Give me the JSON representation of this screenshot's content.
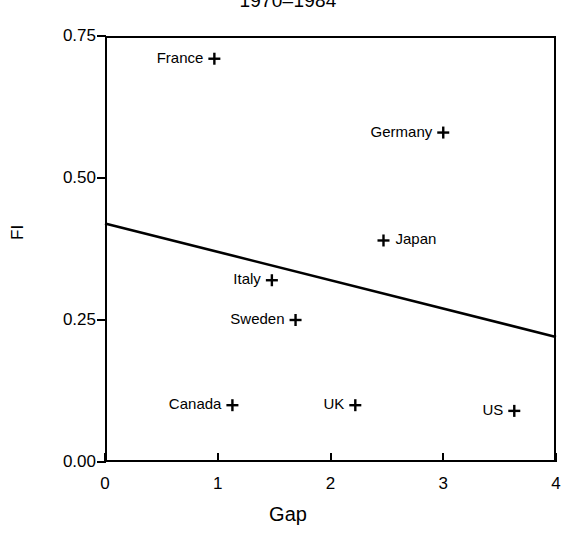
{
  "chart_data": {
    "type": "scatter",
    "title": "1970–1984",
    "xlabel": "Gap",
    "ylabel": "FI",
    "xlim": [
      0,
      4
    ],
    "ylim": [
      0.0,
      0.75
    ],
    "xticks": [
      "0",
      "1",
      "2",
      "3",
      "4"
    ],
    "xtick_values": [
      0,
      1,
      2,
      3,
      4
    ],
    "yticks": [
      "0.00",
      "0.25",
      "0.50",
      "0.75"
    ],
    "ytick_values": [
      0.0,
      0.25,
      0.5,
      0.75
    ],
    "grid": false,
    "legend": "none",
    "marker": "plus",
    "points": [
      {
        "label": "France",
        "x": 0.97,
        "y": 0.71,
        "label_side": "left"
      },
      {
        "label": "Germany",
        "x": 3.0,
        "y": 0.58,
        "label_side": "left"
      },
      {
        "label": "Japan",
        "x": 2.47,
        "y": 0.39,
        "label_side": "right"
      },
      {
        "label": "Italy",
        "x": 1.48,
        "y": 0.32,
        "label_side": "left"
      },
      {
        "label": "Sweden",
        "x": 1.69,
        "y": 0.25,
        "label_side": "left"
      },
      {
        "label": "Canada",
        "x": 1.13,
        "y": 0.1,
        "label_side": "left"
      },
      {
        "label": "UK",
        "x": 2.22,
        "y": 0.1,
        "label_side": "left"
      },
      {
        "label": "US",
        "x": 3.63,
        "y": 0.09,
        "label_side": "left"
      }
    ],
    "series": [
      {
        "name": "regression-line",
        "type": "line",
        "x": [
          0,
          4
        ],
        "y": [
          0.42,
          0.22
        ]
      }
    ],
    "colors": {
      "axis": "#000000",
      "marker": "#000000",
      "line": "#000000",
      "background": "#ffffff"
    }
  }
}
